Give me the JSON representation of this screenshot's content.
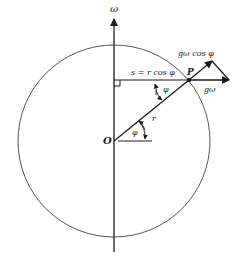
{
  "figure": {
    "axis_label": "ω",
    "origin_label": "O",
    "point_label": "P",
    "radius_label": "r",
    "angle_label_top": "φ",
    "angle_label_bottom": "φ",
    "distance_label": "s = r cos φ",
    "vector_label_horizontal": "gω",
    "vector_label_component": "gω  cos φ",
    "colors": {
      "stroke": "#1a1a1a",
      "circle": "#555555",
      "background": "#ffffff"
    }
  }
}
